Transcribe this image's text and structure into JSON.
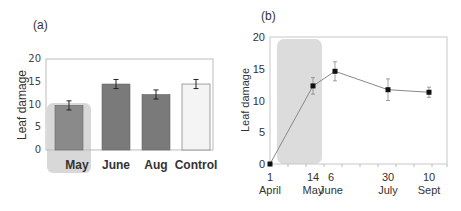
{
  "chart_data": [
    {
      "panel": "(a)",
      "type": "bar",
      "title": "",
      "xlabel": "",
      "ylabel": "Leaf damage",
      "ylim": [
        0,
        20
      ],
      "yticks": [
        0,
        5,
        10,
        15,
        20
      ],
      "categories": [
        "May",
        "June",
        "Aug",
        "Control"
      ],
      "values": [
        9.8,
        14.5,
        12.2,
        14.5
      ],
      "errors": [
        1.0,
        1.0,
        1.0,
        1.0
      ],
      "bar_colors": [
        "#8a8a8a",
        "#7a7a7a",
        "#7a7a7a",
        "#f4f4f4"
      ],
      "highlight": "May",
      "grid": false
    },
    {
      "panel": "(b)",
      "type": "line",
      "title": "",
      "xlabel": "",
      "ylabel": "Leaf damage",
      "ylim": [
        0,
        20
      ],
      "yticks": [
        0,
        5,
        10,
        15,
        20
      ],
      "x_labels": [
        {
          "day": "1",
          "month": "April"
        },
        {
          "day": "14",
          "month": "May"
        },
        {
          "day": "6",
          "month": "June"
        },
        {
          "day": "30",
          "month": "July"
        },
        {
          "day": "10",
          "month": "Sept"
        }
      ],
      "series": [
        {
          "name": "Leaf damage",
          "x": [
            "1 April",
            "14 May",
            "6 June",
            "30 July",
            "10 Sept"
          ],
          "values": [
            0,
            12.3,
            14.6,
            11.7,
            11.3
          ],
          "errors": [
            0,
            1.3,
            1.5,
            1.7,
            0.8
          ]
        }
      ],
      "shaded_region": "1 April – 14 May",
      "grid": false
    }
  ],
  "labels": {
    "panel_a": "(a)",
    "panel_b": "(b)",
    "ylabel_a": "Leaf damage",
    "ylabel_b": "Leaf damage"
  }
}
